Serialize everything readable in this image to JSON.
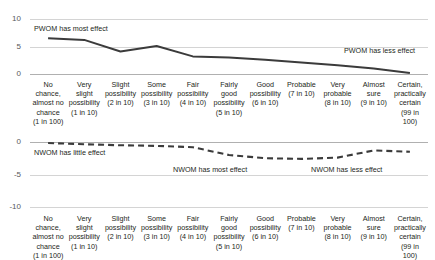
{
  "cropped_title": "",
  "charts": {
    "pwom": {
      "annotation_left": "PWOM has most effect",
      "annotation_right": "PWOM has less effect",
      "yticks": [
        "10",
        "5",
        "0"
      ]
    },
    "nwom": {
      "annotation_left": "NWOM has little effect",
      "annotation_mid": "NWOM has most effect",
      "annotation_right": "NWOM has less effect",
      "yticks": [
        "0",
        "-5",
        "-10"
      ]
    }
  },
  "categories": [
    {
      "label": "No chance,\nalmost no\nchance",
      "prob": "(1 in 100)"
    },
    {
      "label": "Very\nslight\npossibility",
      "prob": "(1 in 10)"
    },
    {
      "label": "Slight\npossibility",
      "prob": "(2 in 10)"
    },
    {
      "label": "Some\npossibility",
      "prob": "(3 in 10)"
    },
    {
      "label": "Fair\npossibility",
      "prob": "(4 in 10)"
    },
    {
      "label": "Fairly\ngood\npossibility",
      "prob": "(5 in 10)"
    },
    {
      "label": "Good\npossibility",
      "prob": "(6 in 10)"
    },
    {
      "label": "Probable",
      "prob": "(7 in 10)"
    },
    {
      "label": "Very\nprobable",
      "prob": "(8 in 10)"
    },
    {
      "label": "Almost\nsure",
      "prob": "(9 in 10)"
    },
    {
      "label": "Certain,\npractically\ncertain",
      "prob": "(99 in 100)"
    }
  ],
  "chart_data": [
    {
      "type": "line",
      "id": "pwom",
      "title": "",
      "xlabel": "",
      "ylabel": "",
      "ylim": [
        0,
        10
      ],
      "yticks": [
        0,
        5,
        10
      ],
      "grid": true,
      "legend": "none",
      "line_style": "solid",
      "line_color": "#3b3b3b",
      "categories": [
        "No chance, almost no chance (1 in 100)",
        "Very slight possibility (1 in 10)",
        "Slight possibility (2 in 10)",
        "Some possibility (3 in 10)",
        "Fair possibility (4 in 10)",
        "Fairly good possibility (5 in 10)",
        "Good possibility (6 in 10)",
        "Probable (7 in 10)",
        "Very probable (8 in 10)",
        "Almost sure (9 in 10)",
        "Certain, practically certain (99 in 100)"
      ],
      "values": [
        6.5,
        6.2,
        4.1,
        5.1,
        3.2,
        3.0,
        2.6,
        2.1,
        1.6,
        1.0,
        0.2
      ],
      "annotations": [
        {
          "text": "PWOM has most effect",
          "x_category_index": 0
        },
        {
          "text": "PWOM has less effect",
          "x_category_index": 9
        }
      ]
    },
    {
      "type": "line",
      "id": "nwom",
      "title": "",
      "xlabel": "",
      "ylabel": "",
      "ylim": [
        -10,
        0
      ],
      "yticks": [
        -10,
        -5,
        0
      ],
      "grid": true,
      "legend": "none",
      "line_style": "dashed",
      "line_color": "#3b3b3b",
      "categories": [
        "No chance, almost no chance (1 in 100)",
        "Very slight possibility (1 in 10)",
        "Slight possibility (2 in 10)",
        "Some possibility (3 in 10)",
        "Fair possibility (4 in 10)",
        "Fairly good possibility (5 in 10)",
        "Good possibility (6 in 10)",
        "Probable (7 in 10)",
        "Very probable (8 in 10)",
        "Almost sure (9 in 10)",
        "Certain, practically certain (99 in 100)"
      ],
      "values": [
        -0.15,
        -0.35,
        -0.5,
        -0.6,
        -0.8,
        -2.0,
        -2.5,
        -2.6,
        -2.4,
        -1.3,
        -1.5
      ],
      "annotations": [
        {
          "text": "NWOM has little effect",
          "x_category_index": 0
        },
        {
          "text": "NWOM has most effect",
          "x_category_index": 5
        },
        {
          "text": "NWOM has less effect",
          "x_category_index": 8
        }
      ]
    }
  ]
}
